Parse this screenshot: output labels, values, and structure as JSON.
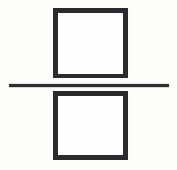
{
  "canvas": {
    "width": 177,
    "height": 170,
    "background_color": "#fdfdfb",
    "ink_color": "#2b2b2d"
  },
  "symbol": {
    "name": "division-sign",
    "unicode": "÷",
    "description": "Division sign drawn as two hollow squares separated by a horizontal rule",
    "style": "hand-drawn scanned line art"
  },
  "shapes": {
    "top_square": {
      "label": "top-square",
      "fill": "none",
      "stroke_color": "#2b2b2d",
      "stroke_width": 5,
      "x": 53,
      "y": 8,
      "width": 75,
      "height": 70
    },
    "divider_line": {
      "label": "divider-line",
      "stroke_color": "#2f2f31",
      "stroke_width": 3,
      "x": 9,
      "y": 84,
      "width": 160,
      "height": 3
    },
    "bottom_square": {
      "label": "bottom-square",
      "fill": "none",
      "stroke_color": "#2b2b2d",
      "stroke_width": 5,
      "x": 53,
      "y": 91,
      "width": 75,
      "height": 69
    }
  },
  "caption": {
    "text": "Division sign formed by two hollow squares above and below a horizontal line"
  }
}
